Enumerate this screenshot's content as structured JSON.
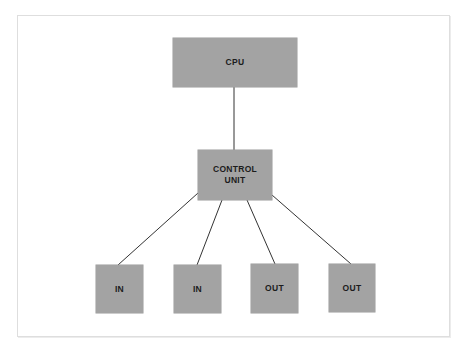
{
  "diagram": {
    "cpu": {
      "label": "CPU"
    },
    "control_unit": {
      "label_line1": "CONTROL",
      "label_line2": "UNIT"
    },
    "devices": [
      {
        "label": "IN"
      },
      {
        "label": "IN"
      },
      {
        "label": "OUT"
      },
      {
        "label": "OUT"
      }
    ],
    "colors": {
      "box_fill": "#a3a3a3",
      "line": "#333333",
      "frame_border": "#dedede",
      "background": "#ffffff"
    }
  }
}
